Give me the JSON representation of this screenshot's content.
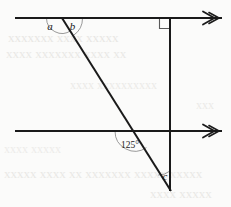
{
  "figure": {
    "background_color": "#fbfbfa",
    "ink_color": "#1a1a1a",
    "arc_color": "#8f8f8f",
    "ghost_color": "#d9d7d2",
    "labels": {
      "angle_a": "a",
      "angle_b": "b",
      "angle_125": "125°",
      "angle_c": "c"
    },
    "geometry": {
      "top_line": {
        "x1": 15,
        "y1": 18,
        "x2": 222,
        "y2": 18,
        "arrow": "right"
      },
      "bottom_line": {
        "x1": 15,
        "y1": 131,
        "x2": 222,
        "y2": 131,
        "arrow": "right"
      },
      "transversal": {
        "x1": 62,
        "y1": 18,
        "x2": 170,
        "y2": 190
      },
      "vertical_line": {
        "x1": 170,
        "y1": 18,
        "x2": 170,
        "y2": 190
      },
      "right_angle_marker": {
        "x": 159,
        "y": 18,
        "size": 10.5
      },
      "vertex_top": {
        "x": 62,
        "y": 18
      },
      "vertex_bottom_left": {
        "x": 135,
        "y": 131
      },
      "vertex_bottom": {
        "x": 170,
        "y": 190
      }
    },
    "arcs": [
      {
        "name": "arc-a",
        "cx": 62,
        "cy": 18,
        "r": 15.5
      },
      {
        "name": "arc-b",
        "cx": 62,
        "cy": 18,
        "r": 20.5
      },
      {
        "name": "arc-125",
        "cx": 135,
        "cy": 131,
        "r": 20.0
      },
      {
        "name": "arc-c",
        "cx": 170,
        "cy": 190,
        "r": 19.0
      }
    ],
    "ghost_lines": [
      {
        "text": "xxxxxxx xxxx xxxxx",
        "x": 8,
        "y": 40,
        "size": 13,
        "opacity": 0.55
      },
      {
        "text": "xxxx xxxxxxx xxxx xx",
        "x": 6,
        "y": 56,
        "size": 13,
        "opacity": 0.5
      },
      {
        "text": "xxxx xxxxxxxxxx",
        "x": 70,
        "y": 88,
        "size": 12,
        "opacity": 0.45
      },
      {
        "text": "xxx",
        "x": 196,
        "y": 108,
        "size": 12,
        "opacity": 0.45
      },
      {
        "text": "xxxx xxxxx",
        "x": 4,
        "y": 152,
        "size": 12,
        "opacity": 0.4
      },
      {
        "text": "xxxxx xxxx xx xxxxxxx xxxxx xxxxx",
        "x": 4,
        "y": 176,
        "size": 13,
        "opacity": 0.5
      },
      {
        "text": "xxxx xxxxx",
        "x": 150,
        "y": 196,
        "size": 13,
        "opacity": 0.5
      }
    ]
  }
}
